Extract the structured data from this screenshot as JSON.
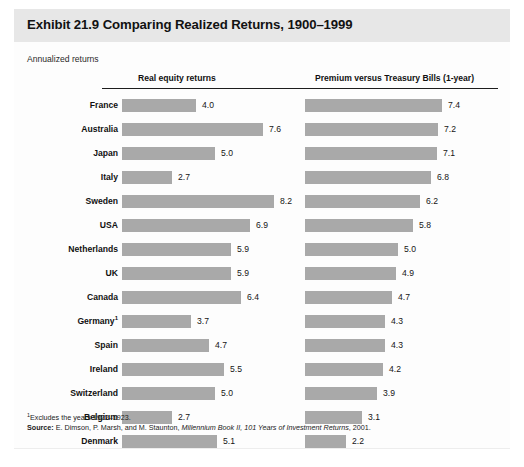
{
  "exhibit": {
    "title": "Exhibit 21.9 Comparing Realized Returns, 1900–1999",
    "subtitle": "Annualized returns",
    "footnote_marker": "1",
    "footnote": "Excludes the years 1922–1923.",
    "source_label": "Source:",
    "source_authors": " E. Dimson, P. Marsh, and M. Staunton, ",
    "source_title": "Millennium Book II, 101 Years of Investment Returns",
    "source_year": ", 2001."
  },
  "colors": {
    "bar": "#a9a9a9",
    "title_band": "#e7e7e7",
    "rule": "#1d1d1d",
    "text": "#121212"
  },
  "chart_data": {
    "type": "bar",
    "title": "Exhibit 21.9 Comparing Realized Returns, 1900–1999",
    "subtitle": "Annualized returns",
    "orientation": "horizontal",
    "xlabel": "",
    "ylabel": "",
    "xlim": [
      0,
      8.2
    ],
    "grid": false,
    "legend": "none",
    "categories": [
      "France",
      "Australia",
      "Japan",
      "Italy",
      "Sweden",
      "USA",
      "Netherlands",
      "UK",
      "Canada",
      "Germany",
      "Spain",
      "Ireland",
      "Switzerland",
      "Belgium",
      "Denmark"
    ],
    "category_notes": {
      "Germany": "1"
    },
    "series": [
      {
        "name": "Real equity returns",
        "values": [
          4.0,
          7.6,
          5.0,
          2.7,
          8.2,
          6.9,
          5.9,
          5.9,
          6.4,
          3.7,
          4.7,
          5.5,
          5.0,
          2.7,
          5.1
        ],
        "labels": [
          "4.0",
          "7.6",
          "5.0",
          "2.7",
          "8.2",
          "6.9",
          "5.9",
          "5.9",
          "6.4",
          "3.7",
          "4.7",
          "5.5",
          "5.0",
          "2.7",
          "5.1"
        ]
      },
      {
        "name": "Premium versus Treasury Bills (1-year)",
        "values": [
          7.4,
          7.2,
          7.1,
          6.8,
          6.2,
          5.8,
          5.0,
          4.9,
          4.7,
          4.3,
          4.3,
          4.2,
          3.9,
          3.1,
          2.2
        ],
        "labels": [
          "7.4",
          "7.2",
          "7.1",
          "6.8",
          "6.2",
          "5.8",
          "5.0",
          "4.9",
          "4.7",
          "4.3",
          "4.3",
          "4.2",
          "3.9",
          "3.1",
          "2.2"
        ]
      }
    ]
  }
}
